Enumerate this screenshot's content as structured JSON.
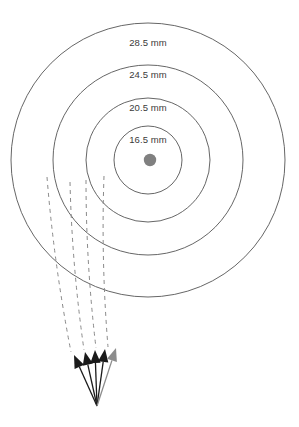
{
  "diagram": {
    "background_color": "#ffffff",
    "canvas": {
      "width": 299,
      "height": 427
    },
    "center": {
      "x": 148,
      "y": 160
    },
    "ring_stroke_color": "#555555",
    "ring_stroke_width": 0.9,
    "label_color": "#3a3a3a",
    "center_dot": {
      "name": "center-dot",
      "x": 150,
      "y": 160,
      "radius": 6.2,
      "fill": "#808080"
    },
    "rings": [
      {
        "label": "16.5 mm",
        "radius": 34,
        "label_x": 148,
        "label_y": 140
      },
      {
        "label": "20.5 mm",
        "radius": 62,
        "label_x": 148,
        "label_y": 108
      },
      {
        "label": "24.5 mm",
        "radius": 95,
        "label_x": 148,
        "label_y": 75
      },
      {
        "label": "28.5 mm",
        "radius": 137,
        "label_x": 148,
        "label_y": 43
      }
    ],
    "converge_point": {
      "x": 97,
      "y": 406
    },
    "arrows": [
      {
        "name": "arrow-1",
        "tip_x": 74,
        "tip_y": 355,
        "color": "#1a1a1a",
        "stroke_width": 1.3
      },
      {
        "name": "arrow-2",
        "tip_x": 85,
        "tip_y": 352,
        "color": "#1a1a1a",
        "stroke_width": 1.3
      },
      {
        "name": "arrow-3",
        "tip_x": 95,
        "tip_y": 350,
        "color": "#1a1a1a",
        "stroke_width": 1.3
      },
      {
        "name": "arrow-4",
        "tip_x": 105,
        "tip_y": 349,
        "color": "#1a1a1a",
        "stroke_width": 1.3
      },
      {
        "name": "arrow-5",
        "tip_x": 116,
        "tip_y": 348,
        "color": "#8c8c8c",
        "stroke_width": 1.3
      }
    ],
    "dashed_guides": [
      {
        "name": "dashed-guide-1",
        "x1": 47,
        "y1": 177,
        "x2": 71,
        "y2": 352,
        "color": "#8a8a8a"
      },
      {
        "name": "dashed-guide-2",
        "x1": 70,
        "y1": 182,
        "x2": 84,
        "y2": 350,
        "color": "#8a8a8a"
      },
      {
        "name": "dashed-guide-3",
        "x1": 86,
        "y1": 180,
        "x2": 96,
        "y2": 348,
        "color": "#8a8a8a"
      },
      {
        "name": "dashed-guide-4",
        "x1": 104,
        "y1": 176,
        "x2": 108,
        "y2": 347,
        "color": "#8a8a8a"
      }
    ]
  },
  "chart_data": {
    "type": "diagram",
    "units": "mm",
    "categories": [
      "16.5 mm",
      "20.5 mm",
      "24.5 mm",
      "28.5 mm"
    ],
    "values": [
      16.5,
      20.5,
      24.5,
      28.5
    ],
    "pixel_radii": [
      34,
      62,
      95,
      137
    ],
    "legend": "",
    "xlabel": "",
    "ylabel": "",
    "grid": false,
    "annotations": [
      "Five converging arrows originate from a single point below the rings",
      "Four dashed guide lines run tangentially from the rings down to the arrow tips"
    ]
  }
}
